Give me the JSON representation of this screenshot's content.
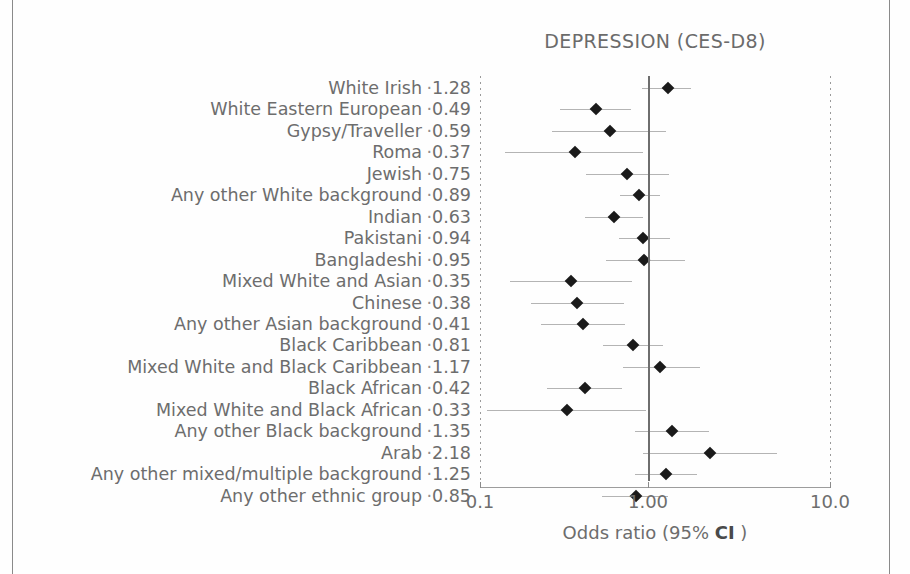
{
  "figure": {
    "title": "DEPRESSION (CES-D8)",
    "axis_caption_prefix": "Odds ratio (95% ",
    "axis_caption_abbrev": "CI",
    "axis_caption_suffix": " )",
    "label_dot": "·",
    "tick_labels": [
      "0.1",
      "1.00",
      "10.0"
    ],
    "colors": {
      "marker": "#1a1a1a",
      "ci": "#b4b4b4",
      "reference_line": "#6e6e6e",
      "text": "#6d6d6d",
      "frame": "#8a8a8a",
      "background": "#fefefe"
    }
  },
  "chart_data": {
    "type": "scatter",
    "title": "DEPRESSION (CES-D8)",
    "xlabel": "Odds ratio (95% CI )",
    "ylabel": "",
    "xscale": "log",
    "xlim": [
      0.1,
      10.0
    ],
    "xticks": [
      0.1,
      1.0,
      10.0
    ],
    "xtick_labels": [
      "0.1",
      "1.00",
      "10.0"
    ],
    "reference_line_x": 1.0,
    "grid": false,
    "legend": "none",
    "categories": [
      "White Irish",
      "White Eastern European",
      "Gypsy/Traveller",
      "Roma",
      "Jewish",
      "Any other White background",
      "Indian",
      "Pakistani",
      "Bangladeshi",
      "Mixed White and Asian",
      "Chinese",
      "Any other Asian background",
      "Black Caribbean",
      "Mixed White and Black Caribbean",
      "Black African",
      "Mixed White and Black African",
      "Any other Black background",
      "Arab",
      "Any other mixed/multiple background",
      "Any other ethnic group"
    ],
    "values": [
      1.28,
      0.49,
      0.59,
      0.37,
      0.75,
      0.89,
      0.63,
      0.94,
      0.95,
      0.35,
      0.38,
      0.41,
      0.81,
      1.17,
      0.42,
      0.33,
      1.35,
      2.18,
      1.25,
      0.85
    ],
    "value_labels": [
      "1.28",
      "0.49",
      "0.59",
      "0.37",
      "0.75",
      "0.89",
      "0.63",
      "0.94",
      "0.95",
      "0.35",
      "0.38",
      "0.41",
      "0.81",
      "1.17",
      "0.42",
      "0.33",
      "1.35",
      "2.18",
      "1.25",
      "0.85"
    ],
    "points": [
      {
        "label": "White Irish",
        "or": 1.28,
        "or_text": "1.28",
        "ci_low": 0.92,
        "ci_high": 1.72
      },
      {
        "label": "White Eastern European",
        "or": 0.49,
        "or_text": "0.49",
        "ci_low": 0.3,
        "ci_high": 0.79
      },
      {
        "label": "Gypsy/Traveller",
        "or": 0.59,
        "or_text": "0.59",
        "ci_low": 0.27,
        "ci_high": 1.25
      },
      {
        "label": "Roma",
        "or": 0.37,
        "or_text": "0.37",
        "ci_low": 0.14,
        "ci_high": 0.94
      },
      {
        "label": "Jewish",
        "or": 0.75,
        "or_text": "0.75",
        "ci_low": 0.43,
        "ci_high": 1.3
      },
      {
        "label": "Any other White background",
        "or": 0.89,
        "or_text": "0.89",
        "ci_low": 0.68,
        "ci_high": 1.16
      },
      {
        "label": "Indian",
        "or": 0.63,
        "or_text": "0.63",
        "ci_low": 0.42,
        "ci_high": 0.93
      },
      {
        "label": "Pakistani",
        "or": 0.94,
        "or_text": "0.94",
        "ci_low": 0.67,
        "ci_high": 1.32
      },
      {
        "label": "Bangladeshi",
        "or": 0.95,
        "or_text": "0.95",
        "ci_low": 0.56,
        "ci_high": 1.6
      },
      {
        "label": "Mixed White and Asian",
        "or": 0.35,
        "or_text": "0.35",
        "ci_low": 0.15,
        "ci_high": 0.8
      },
      {
        "label": "Chinese",
        "or": 0.38,
        "or_text": "0.38",
        "ci_low": 0.2,
        "ci_high": 0.72
      },
      {
        "label": "Any other Asian background",
        "or": 0.41,
        "or_text": "0.41",
        "ci_low": 0.23,
        "ci_high": 0.73
      },
      {
        "label": "Black Caribbean",
        "or": 0.81,
        "or_text": "0.81",
        "ci_low": 0.54,
        "ci_high": 1.21
      },
      {
        "label": "Mixed White and Black Caribbean",
        "or": 1.17,
        "or_text": "1.17",
        "ci_low": 0.71,
        "ci_high": 1.93
      },
      {
        "label": "Black African",
        "or": 0.42,
        "or_text": "0.42",
        "ci_low": 0.25,
        "ci_high": 0.7
      },
      {
        "label": "Mixed White and Black African",
        "or": 0.33,
        "or_text": "0.33",
        "ci_low": 0.11,
        "ci_high": 0.97
      },
      {
        "label": "Any other Black background",
        "or": 1.35,
        "or_text": "1.35",
        "ci_low": 0.84,
        "ci_high": 2.17
      },
      {
        "label": "Arab",
        "or": 2.18,
        "or_text": "2.18",
        "ci_low": 0.93,
        "ci_high": 5.1
      },
      {
        "label": "Any other mixed/multiple background",
        "or": 1.25,
        "or_text": "1.25",
        "ci_low": 0.84,
        "ci_high": 1.86
      },
      {
        "label": "Any other ethnic group",
        "or": 0.85,
        "or_text": "0.85",
        "ci_low": 0.53,
        "ci_high": 1.28
      }
    ]
  }
}
